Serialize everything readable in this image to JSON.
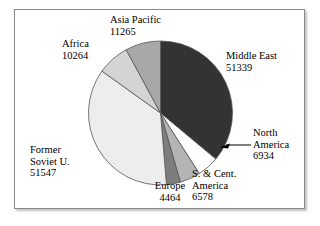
{
  "chart_data": {
    "type": "pie",
    "title": "",
    "subtitle": "",
    "xlabel": "",
    "ylabel": "",
    "legend_position": "none",
    "grid": false,
    "total": 142391,
    "units": "",
    "start_angle_deg": 0,
    "direction": "clockwise",
    "categories": [
      "Middle East",
      "North America",
      "S. & Cent. America",
      "Europe",
      "Former Soviet U.",
      "Africa",
      "Asia Pacific"
    ],
    "values": [
      51339,
      6934,
      6578,
      4464,
      51547,
      10264,
      11265
    ],
    "slices": [
      {
        "name": "Middle East",
        "value": 51339,
        "value_text": "51339",
        "label_lines": [
          "Middle East",
          "51339"
        ],
        "color": "#333333",
        "angle_deg": 129.8,
        "percent": 36.1,
        "leader_line": false
      },
      {
        "name": "North America",
        "value": 6934,
        "value_text": "6934",
        "label_lines": [
          "North",
          "America",
          "6934"
        ],
        "color": "#ffffff",
        "angle_deg": 17.5,
        "percent": 4.9,
        "leader_line": true
      },
      {
        "name": "S. & Cent. America",
        "value": 6578,
        "value_text": "6578",
        "label_lines": [
          "S. & Cent.",
          "America",
          "6578"
        ],
        "color": "#b4b4b4",
        "angle_deg": 16.6,
        "percent": 4.6,
        "leader_line": false
      },
      {
        "name": "Europe",
        "value": 4464,
        "value_text": "4464",
        "label_lines": [
          "Europe",
          "4464"
        ],
        "color": "#7d7d7d",
        "angle_deg": 11.3,
        "percent": 3.1,
        "leader_line": false
      },
      {
        "name": "Former Soviet U.",
        "value": 51547,
        "value_text": "51547",
        "label_lines": [
          "Former",
          "Soviet U.",
          "51547"
        ],
        "color": "#ededed",
        "angle_deg": 130.3,
        "percent": 36.2,
        "leader_line": false
      },
      {
        "name": "Africa",
        "value": 10264,
        "value_text": "10264",
        "label_lines": [
          "Africa",
          "10264"
        ],
        "color": "#d4d4d4",
        "angle_deg": 26.0,
        "percent": 7.2,
        "leader_line": false
      },
      {
        "name": "Asia Pacific",
        "value": 11265,
        "value_text": "11265",
        "label_lines": [
          "Asia Pacific",
          "11265"
        ],
        "color": "#a8a8a8",
        "angle_deg": 28.5,
        "percent": 7.9,
        "leader_line": false
      }
    ]
  },
  "labels": {
    "asia_pacific": {
      "name": "Asia Pacific",
      "value": "11265"
    },
    "africa": {
      "name": "Africa",
      "value": "10264"
    },
    "middle_east": {
      "name": "Middle East",
      "value": "51339"
    },
    "north_america": {
      "name_line1": "North",
      "name_line2": "America",
      "value": "6934"
    },
    "s_cent_america": {
      "name_line1": "S. & Cent.",
      "name_line2": "America",
      "value": "6578"
    },
    "europe": {
      "name": "Europe",
      "value": "4464"
    },
    "former_soviet": {
      "name_line1": "Former",
      "name_line2": "Soviet U.",
      "value": "51547"
    }
  },
  "style": {
    "background": "#ffffff",
    "frame_border": "#8a8a8a",
    "slice_outline": "#555555",
    "text_color": "#000000",
    "leader_line_color": "#000000"
  }
}
